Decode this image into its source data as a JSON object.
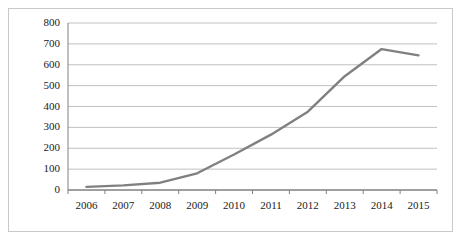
{
  "chart_data": {
    "type": "line",
    "title": "",
    "xlabel": "",
    "ylabel": "",
    "x": [
      2006,
      2007,
      2008,
      2009,
      2010,
      2011,
      2012,
      2013,
      2014,
      2015
    ],
    "categories": [
      "2006",
      "2007",
      "2008",
      "2009",
      "2010",
      "2011",
      "2012",
      "2013",
      "2014",
      "2015"
    ],
    "values": [
      15,
      22,
      35,
      80,
      170,
      265,
      375,
      545,
      675,
      645
    ],
    "series": [
      {
        "name": "series-1",
        "values": [
          15,
          22,
          35,
          80,
          170,
          265,
          375,
          545,
          675,
          645
        ],
        "color": "#808080"
      }
    ],
    "ylim": [
      0,
      800
    ],
    "yticks": [
      0,
      100,
      200,
      300,
      400,
      500,
      600,
      700,
      800
    ],
    "ytick_labels": [
      "0",
      "100",
      "200",
      "300",
      "400",
      "500",
      "600",
      "700",
      "800"
    ],
    "xtick_labels": [
      "2006",
      "2007",
      "2008",
      "2009",
      "2010",
      "2011",
      "2012",
      "2013",
      "2014",
      "2015"
    ],
    "grid": "horizontal",
    "legend": "none",
    "annotations": []
  },
  "colors": {
    "line": "#808080",
    "gridline": "#c0c0c0",
    "axis": "#808080",
    "frame": "#c8c8c8",
    "text": "#1a1a1a",
    "background": "#ffffff"
  }
}
